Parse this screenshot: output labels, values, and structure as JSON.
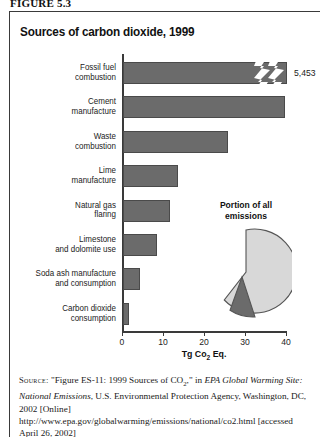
{
  "figure": {
    "number_label": "FIGURE 5.3",
    "title": "Sources of carbon dioxide, 1999"
  },
  "chart_data": {
    "type": "bar",
    "orientation": "horizontal",
    "title": "Sources of carbon dioxide, 1999",
    "xlabel": "Tg Co2 Eq.",
    "ylabel": "",
    "xlim": [
      0,
      40
    ],
    "xticks": [
      0,
      10,
      20,
      30,
      40
    ],
    "grid": false,
    "legend": "none",
    "broken_axis": true,
    "broken_axis_note": "Fossil fuel combustion bar is truncated with a zigzag break; true value 5,453",
    "categories": [
      "Fossil fuel combustion",
      "Cement manufacture",
      "Waste combustion",
      "Lime manufacture",
      "Natural gas flaring",
      "Limestone and dolomite use",
      "Soda ash manufacture and consumption",
      "Carbon dioxide consumption"
    ],
    "values": [
      5453,
      39.5,
      25.5,
      13.3,
      11.5,
      8.3,
      4.2,
      1.4
    ],
    "value_labels": [
      "5,453",
      "",
      "",
      "",
      "",
      "",
      "",
      ""
    ],
    "colors": {
      "bar": "#6b6b6b",
      "bar_edge": "#4a4a4a",
      "axis": "#3a3a3a"
    }
  },
  "bars": [
    {
      "label": "Fossil fuel\ncombustion",
      "value": 5453,
      "value_label": "5,453",
      "drawn_width_pct": 100,
      "broken": true
    },
    {
      "label": "Cement\nmanufacture",
      "value": 39.5,
      "value_label": "",
      "drawn_width_pct": 98.75,
      "broken": false
    },
    {
      "label": "Waste\ncombustion",
      "value": 25.5,
      "value_label": "",
      "drawn_width_pct": 63.75,
      "broken": false
    },
    {
      "label": "Lime\nmanufacture",
      "value": 13.3,
      "value_label": "",
      "drawn_width_pct": 33.25,
      "broken": false
    },
    {
      "label": "Natural gas\nflaring",
      "value": 11.5,
      "value_label": "",
      "drawn_width_pct": 28.75,
      "broken": false
    },
    {
      "label": "Limestone\nand dolomite use",
      "value": 8.3,
      "value_label": "",
      "drawn_width_pct": 20.75,
      "broken": false
    },
    {
      "label": "Soda ash manufacture\nand consumption",
      "value": 4.2,
      "value_label": "",
      "drawn_width_pct": 10.5,
      "broken": false
    },
    {
      "label": "Carbon dioxide\nconsumption",
      "value": 1.4,
      "value_label": "",
      "drawn_width_pct": 3.5,
      "broken": false
    }
  ],
  "axis": {
    "ticks": [
      "0",
      "10",
      "20",
      "30",
      "40"
    ],
    "label_text": "Tg Co",
    "label_sub": "2",
    "label_tail": " Eq."
  },
  "pie_inset": {
    "title": "Portion of all\nemissions",
    "chart_data": {
      "type": "pie",
      "title": "Portion of all emissions",
      "slices": [
        {
          "name": "Other emissions",
          "value": 85,
          "color": "#d8d8d8"
        },
        {
          "name": "Carbon dioxide portion",
          "value": 15,
          "color": "#6b6b6b",
          "exploded": true
        }
      ]
    }
  },
  "source": {
    "label": "Source:",
    "part1": " \"Figure ES-11: 1999 Sources of CO",
    "sub": "2",
    "part2": ",\" in ",
    "italic1": "EPA Global Warming Site: National Emissions",
    "part3": ", U.S. Environmental Protection Agency, Washington, DC, 2002 [Online] http://www.epa.gov/globalwarming/emissions/national/co2.html [accessed April 26, 2002]"
  }
}
